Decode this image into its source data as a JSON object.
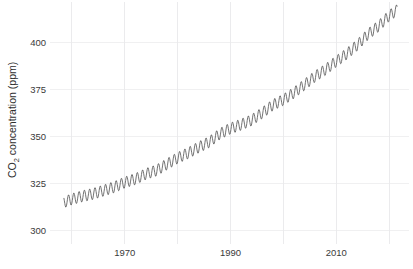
{
  "chart_data": {
    "type": "line",
    "title": "",
    "subtitle": "",
    "xlabel": "",
    "ylabel": "CO2 concentration (ppm)",
    "ylabel_parts": {
      "pre": "CO",
      "sub": "2",
      "post": " concentration (ppm)"
    },
    "grid": true,
    "legend": "none",
    "xlim": [
      1958,
      1968.5
    ],
    "ylim": [
      296,
      416
    ],
    "x_ticks": [
      1970,
      1990,
      2010
    ],
    "x_tick_labels": [
      "1970",
      "1990",
      "2010"
    ],
    "x_minor_gridlines": [
      1960,
      1980,
      2000,
      2020
    ],
    "y_ticks": [
      300,
      325,
      350,
      375,
      400
    ],
    "y_tick_labels": [
      "300",
      "325",
      "350",
      "375",
      "400"
    ],
    "series": [
      {
        "name": "Monthly mean CO2",
        "description": "Monthly atmospheric CO2 concentration with seasonal cycle (Keeling Curve)",
        "annual_trend_x": [
          1958.5,
          1960,
          1962,
          1964,
          1966,
          1968,
          1970,
          1972,
          1974,
          1976,
          1978,
          1980,
          1982,
          1984,
          1986,
          1988,
          1990,
          1992,
          1994,
          1996,
          1998,
          2000,
          2002,
          2004,
          2006,
          2008,
          2010,
          2012,
          2014,
          2016,
          2018,
          2020,
          2021.5
        ],
        "annual_trend_y": [
          315.0,
          316.6,
          318.2,
          319.4,
          321.2,
          323.0,
          325.5,
          327.3,
          330.0,
          331.9,
          335.2,
          338.5,
          341.1,
          344.2,
          347.0,
          351.3,
          354.2,
          356.2,
          358.6,
          362.4,
          366.6,
          369.4,
          373.1,
          377.4,
          381.8,
          385.5,
          389.8,
          393.8,
          398.5,
          404.2,
          408.5,
          414.0,
          417.0
        ]
      }
    ],
    "notes": {
      "seasonal_amplitude_ppm": 6.0,
      "seasonal_peak_month": "May",
      "seasonal_trough_month": "September",
      "data_start_year": 1958.5,
      "data_end_year": 2021.5,
      "value_at_start_ppm": 315,
      "value_at_end_ppm": 417
    },
    "colors": {
      "line": "#5a5a5a",
      "gridline": "#ececed",
      "tick_label": "#3a3a3a",
      "axis_title": "#2e2e2e",
      "background": "#ffffff"
    }
  }
}
